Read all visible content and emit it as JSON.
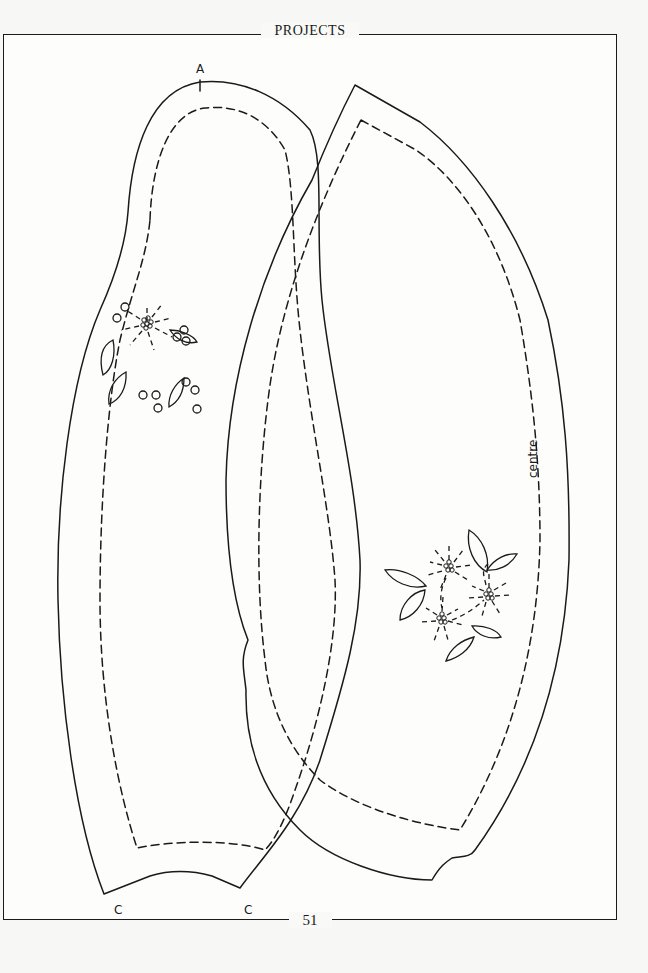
{
  "page": {
    "header": "PROJECTS",
    "page_number": "51"
  },
  "pattern_pieces": {
    "left_piece": {
      "top_mark_label": "A",
      "bottom_left_label": "C",
      "bottom_right_label": "C"
    },
    "right_piece": {
      "fold_label": "centre"
    }
  },
  "colors": {
    "ink": "#1a1a1a",
    "paper": "#fdfdfc"
  }
}
